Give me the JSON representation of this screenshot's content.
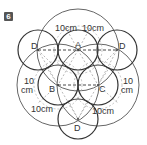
{
  "problem": {
    "number": "6"
  },
  "diagram": {
    "circle_labels": {
      "A": "A",
      "B": "B",
      "C": "C",
      "D_left": "D",
      "D_right": "D",
      "D_bottom": "D"
    },
    "measurements": {
      "top_left": "10cm",
      "top_right": "10cm",
      "left_1": "10",
      "left_2": "cm",
      "right_1": "10",
      "right_2": "cm",
      "bottom_left": "10cm",
      "bottom_right": "10cm"
    },
    "colors": {
      "small_circle_stroke": "#333333",
      "large_circle_stroke": "#666666",
      "dashed_line": "#333333",
      "dashed_guide": "#999999",
      "badge_bg": "#555555"
    }
  }
}
